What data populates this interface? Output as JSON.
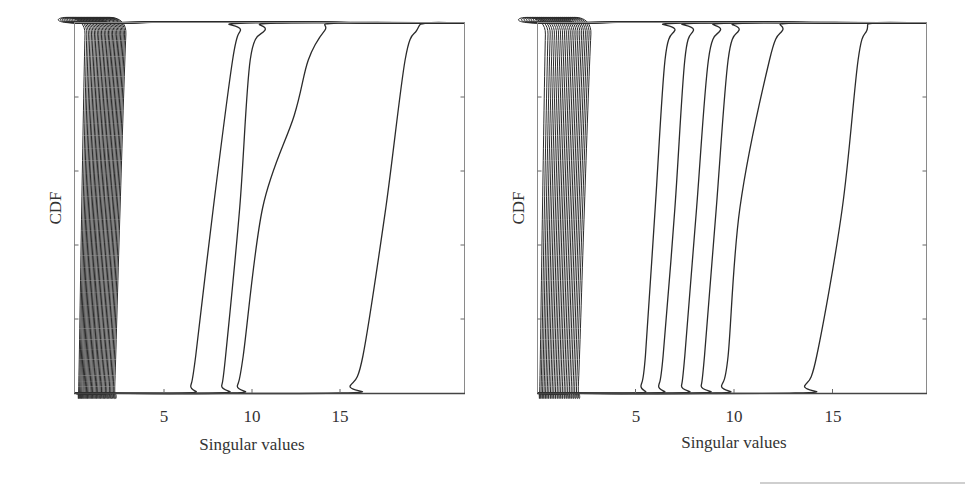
{
  "chart_data": [
    {
      "type": "line",
      "title": "",
      "xlabel": "Singular values",
      "ylabel": "CDF",
      "xlim": [
        0,
        22
      ],
      "ylim": [
        0,
        1
      ],
      "xticks": [
        5,
        10,
        15
      ],
      "xtick_labels": [
        "5",
        "10",
        "15"
      ],
      "yticks": [
        0.2,
        0.4,
        0.6,
        0.8
      ],
      "ytick_labels": [],
      "grid": false,
      "legend": null,
      "dense_group": {
        "count": 30,
        "start_min": 0.1,
        "start_max": 2.1,
        "end_min": 0.6,
        "end_max": 3.0
      },
      "series": [
        {
          "name": "sv-A",
          "start": 6.3,
          "end": 9.7,
          "x_at_cdf": {
            "0.1": 6.8,
            "0.5": 7.8,
            "0.9": 8.9
          }
        },
        {
          "name": "sv-B",
          "start": 8.1,
          "end": 11.4,
          "x_at_cdf": {
            "0.1": 8.5,
            "0.5": 9.3,
            "0.9": 9.9
          }
        },
        {
          "name": "sv-C",
          "start": 8.9,
          "end": 14.9,
          "x_at_cdf": {
            "0.1": 9.5,
            "0.5": 10.6,
            "0.75": 12.4,
            "0.9": 13.2
          }
        },
        {
          "name": "sv-D",
          "start": 15.0,
          "end": 19.9,
          "x_at_cdf": {
            "0.1": 16.3,
            "0.5": 17.6,
            "0.9": 18.7
          }
        }
      ]
    },
    {
      "type": "line",
      "title": "",
      "xlabel": "Singular values",
      "ylabel": "CDF",
      "xlim": [
        0,
        19.7
      ],
      "ylim": [
        0,
        1
      ],
      "xticks": [
        5,
        10,
        15
      ],
      "xtick_labels": [
        "5",
        "10",
        "15"
      ],
      "yticks": [
        0.2,
        0.4,
        0.6,
        0.8
      ],
      "ytick_labels": [],
      "grid": false,
      "legend": null,
      "dense_group": {
        "count": 24,
        "start_min": 0.1,
        "start_max": 2.0,
        "end_min": 0.5,
        "end_max": 2.9
      },
      "series": [
        {
          "name": "sv-R1",
          "start": 5.1,
          "end": 7.4,
          "x_at_cdf": {
            "0.1": 5.5,
            "0.5": 6.0,
            "0.9": 6.5
          }
        },
        {
          "name": "sv-R2",
          "start": 6.0,
          "end": 8.3,
          "x_at_cdf": {
            "0.1": 6.4,
            "0.5": 7.0,
            "0.9": 7.5
          }
        },
        {
          "name": "sv-R3",
          "start": 7.2,
          "end": 9.8,
          "x_at_cdf": {
            "0.1": 7.5,
            "0.5": 8.1,
            "0.9": 8.7
          }
        },
        {
          "name": "sv-R4",
          "start": 8.2,
          "end": 10.7,
          "x_at_cdf": {
            "0.1": 8.5,
            "0.5": 9.1,
            "0.9": 9.7
          }
        },
        {
          "name": "sv-R5",
          "start": 9.1,
          "end": 13.0,
          "x_at_cdf": {
            "0.1": 9.7,
            "0.5": 10.3,
            "0.9": 11.8
          }
        },
        {
          "name": "sv-R6",
          "start": 13.1,
          "end": 17.1,
          "x_at_cdf": {
            "0.1": 14.2,
            "0.5": 15.5,
            "0.9": 16.3
          }
        }
      ]
    }
  ],
  "panels": [
    {
      "xlabel": "Singular values",
      "ylabel": "CDF",
      "ticks": [
        "5",
        "10",
        "15"
      ]
    },
    {
      "xlabel": "Singular values",
      "ylabel": "CDF",
      "ticks": [
        "5",
        "10",
        "15"
      ]
    }
  ],
  "colors": {
    "line": "#2b2b2b",
    "axis": "#7a7a7a",
    "text": "#333333",
    "background": "#ffffff"
  }
}
